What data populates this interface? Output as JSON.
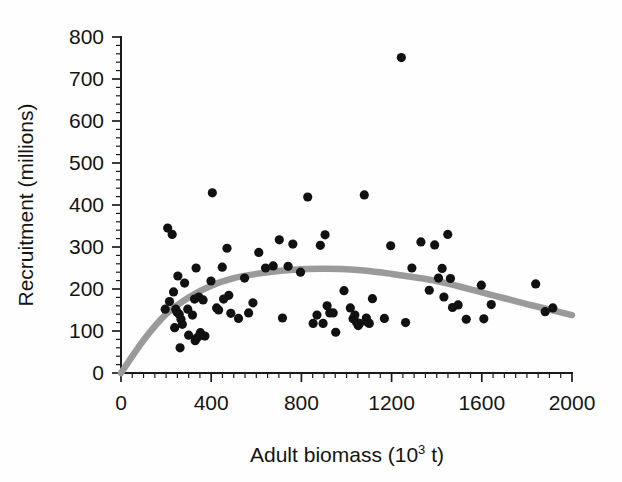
{
  "chart_data": {
    "type": "scatter",
    "title": "",
    "xlabel": "Adult biomass (10³ t)",
    "xlabel_base": "Adult biomass (10",
    "xlabel_exp": "3",
    "xlabel_tail": " t)",
    "ylabel": "Recruitment (millions)",
    "xlim": [
      0,
      2000
    ],
    "ylim": [
      0,
      800
    ],
    "xticks": [
      0,
      400,
      800,
      1200,
      1600,
      2000
    ],
    "yticks": [
      0,
      100,
      200,
      300,
      400,
      500,
      600,
      700,
      800
    ],
    "xtick_labels": [
      "0",
      "400",
      "800",
      "1200",
      "1600",
      "2000"
    ],
    "ytick_labels": [
      "0",
      "100",
      "200",
      "300",
      "400",
      "500",
      "600",
      "700",
      "800"
    ],
    "x_minor_interval": 50,
    "y_minor_interval": 20,
    "grid": false,
    "legend": false,
    "marker": "filled-circle",
    "marker_color": "#111111",
    "marker_radius_px": 4.6,
    "series": [
      {
        "name": "Stock-recruitment observations",
        "points": [
          [
            196,
            152
          ],
          [
            207,
            345
          ],
          [
            215,
            170
          ],
          [
            227,
            330
          ],
          [
            233,
            193
          ],
          [
            238,
            108
          ],
          [
            243,
            152
          ],
          [
            248,
            145
          ],
          [
            252,
            231
          ],
          [
            258,
            140
          ],
          [
            262,
            60
          ],
          [
            266,
            128
          ],
          [
            272,
            116
          ],
          [
            282,
            214
          ],
          [
            296,
            152
          ],
          [
            300,
            90
          ],
          [
            317,
            138
          ],
          [
            326,
            176
          ],
          [
            329,
            77
          ],
          [
            333,
            250
          ],
          [
            338,
            84
          ],
          [
            345,
            181
          ],
          [
            352,
            96
          ],
          [
            356,
            90
          ],
          [
            364,
            174
          ],
          [
            372,
            88
          ],
          [
            399,
            219
          ],
          [
            405,
            429
          ],
          [
            424,
            155
          ],
          [
            433,
            150
          ],
          [
            449,
            252
          ],
          [
            455,
            176
          ],
          [
            470,
            297
          ],
          [
            478,
            185
          ],
          [
            487,
            142
          ],
          [
            521,
            130
          ],
          [
            548,
            226
          ],
          [
            566,
            143
          ],
          [
            585,
            167
          ],
          [
            611,
            287
          ],
          [
            641,
            250
          ],
          [
            675,
            255
          ],
          [
            702,
            317
          ],
          [
            716,
            131
          ],
          [
            741,
            254
          ],
          [
            762,
            307
          ],
          [
            796,
            240
          ],
          [
            828,
            419
          ],
          [
            852,
            118
          ],
          [
            869,
            138
          ],
          [
            884,
            304
          ],
          [
            896,
            118
          ],
          [
            905,
            329
          ],
          [
            914,
            160
          ],
          [
            926,
            143
          ],
          [
            941,
            143
          ],
          [
            952,
            97
          ],
          [
            989,
            196
          ],
          [
            1017,
            155
          ],
          [
            1029,
            129
          ],
          [
            1037,
            138
          ],
          [
            1045,
            120
          ],
          [
            1052,
            113
          ],
          [
            1058,
            118
          ],
          [
            1079,
            424
          ],
          [
            1088,
            131
          ],
          [
            1095,
            120
          ],
          [
            1101,
            118
          ],
          [
            1115,
            177
          ],
          [
            1168,
            130
          ],
          [
            1196,
            303
          ],
          [
            1243,
            751
          ],
          [
            1262,
            120
          ],
          [
            1290,
            250
          ],
          [
            1330,
            312
          ],
          [
            1367,
            197
          ],
          [
            1391,
            305
          ],
          [
            1408,
            226
          ],
          [
            1424,
            249
          ],
          [
            1432,
            181
          ],
          [
            1449,
            330
          ],
          [
            1461,
            225
          ],
          [
            1470,
            156
          ],
          [
            1495,
            162
          ],
          [
            1531,
            128
          ],
          [
            1598,
            209
          ],
          [
            1609,
            129
          ],
          [
            1642,
            163
          ],
          [
            1839,
            212
          ],
          [
            1881,
            146
          ],
          [
            1915,
            155
          ]
        ]
      }
    ],
    "fit_curve": {
      "name": "Ricker stock-recruitment fit",
      "color": "#9a9a9a",
      "width_px": 6.5,
      "points": [
        [
          0,
          0
        ],
        [
          100,
          78
        ],
        [
          200,
          140
        ],
        [
          300,
          180
        ],
        [
          400,
          208
        ],
        [
          500,
          226
        ],
        [
          600,
          236
        ],
        [
          700,
          243
        ],
        [
          800,
          247
        ],
        [
          900,
          248
        ],
        [
          1000,
          247
        ],
        [
          1100,
          243
        ],
        [
          1200,
          236
        ],
        [
          1300,
          228
        ],
        [
          1400,
          219
        ],
        [
          1500,
          206
        ],
        [
          1600,
          192
        ],
        [
          1700,
          178
        ],
        [
          1800,
          164
        ],
        [
          1900,
          151
        ],
        [
          2000,
          138
        ]
      ]
    }
  },
  "axes": {
    "origin_px": [
      121,
      373
    ],
    "x_end_px": [
      572,
      373
    ],
    "y_end_px": [
      121,
      37
    ]
  }
}
